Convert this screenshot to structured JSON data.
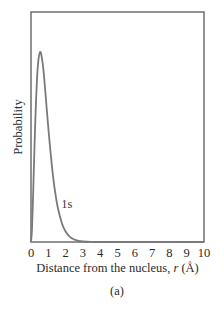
{
  "chart_data": {
    "type": "line",
    "title": "",
    "xlabel": "Distance from the nucleus, r (Å)",
    "xlabel_parts": {
      "prefix": "Distance from the nucleus, ",
      "var": "r",
      "suffix": " (Å)"
    },
    "ylabel": "Probability",
    "caption": "(a)",
    "xlim": [
      0,
      10
    ],
    "ylim": [
      0,
      1.21
    ],
    "x_ticks": [
      0,
      1,
      2,
      3,
      4,
      5,
      6,
      7,
      8,
      9,
      10
    ],
    "x_tick_labels": [
      "0",
      "1",
      "2",
      "3",
      "4",
      "5",
      "6",
      "7",
      "8",
      "9",
      "10"
    ],
    "y_ticks": [],
    "grid": false,
    "legend": null,
    "series": [
      {
        "name": "1s",
        "label_position": {
          "x": 1.75,
          "y": 0.2
        },
        "color": "#7a7a7a",
        "x": [
          0,
          0.05,
          0.1,
          0.15,
          0.2,
          0.25,
          0.3,
          0.35,
          0.4,
          0.45,
          0.53,
          0.6,
          0.7,
          0.8,
          0.9,
          1.0,
          1.1,
          1.2,
          1.3,
          1.4,
          1.5,
          1.6,
          1.8,
          2.0,
          2.25,
          2.5,
          2.75,
          3.0,
          3.5,
          4.0,
          5.0,
          6.0,
          7.0,
          8.0,
          9.0,
          10.0
        ],
        "values": [
          0,
          0.056,
          0.181,
          0.336,
          0.496,
          0.64,
          0.764,
          0.862,
          0.931,
          0.973,
          1.0,
          0.984,
          0.921,
          0.821,
          0.71,
          0.602,
          0.5,
          0.407,
          0.327,
          0.26,
          0.204,
          0.16,
          0.0948,
          0.0549,
          0.0274,
          0.013,
          0.006,
          0.0027,
          0.0005,
          0.0001,
          0,
          0,
          0,
          0,
          0,
          0
        ]
      }
    ],
    "annotations": [
      {
        "text": "1s",
        "x": 1.75,
        "y": 0.2
      }
    ]
  },
  "colors": {
    "frame": "#6e6e6e",
    "curve": "#7a7a7a",
    "text": "#2b2b2b"
  }
}
